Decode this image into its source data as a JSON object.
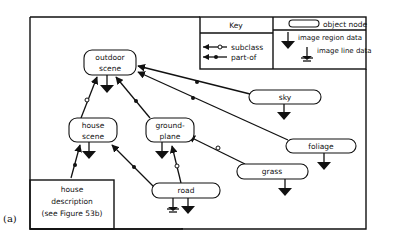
{
  "figure": {
    "caption": "(a)",
    "key": {
      "title": "Key",
      "object_node_label": "object node",
      "subclass_label": "subclass",
      "part_of_label": "part-of",
      "image_region_label": "image region data",
      "image_line_label": "image line data"
    },
    "nodes": {
      "outdoor_scene": {
        "line1": "outdoor",
        "line2": "scene"
      },
      "house_scene": {
        "line1": "house",
        "line2": "scene"
      },
      "ground_plane": {
        "line1": "ground-",
        "line2": "plane"
      },
      "sky": {
        "label": "sky"
      },
      "foliage": {
        "label": "foliage"
      },
      "grass": {
        "label": "grass"
      },
      "road": {
        "label": "road"
      },
      "house_description": {
        "line1": "house",
        "line2": "description",
        "line3": "(see Figure 53b)"
      }
    },
    "edges": [
      {
        "from": "house_scene",
        "to": "outdoor_scene",
        "type": "subclass"
      },
      {
        "from": "ground_plane",
        "to": "outdoor_scene",
        "type": "part-of"
      },
      {
        "from": "sky",
        "to": "outdoor_scene",
        "type": "part-of"
      },
      {
        "from": "foliage",
        "to": "outdoor_scene",
        "type": "part-of"
      },
      {
        "from": "house_description",
        "to": "house_scene",
        "type": "part-of"
      },
      {
        "from": "road",
        "to": "house_scene",
        "type": "part-of"
      },
      {
        "from": "road",
        "to": "ground_plane",
        "type": "subclass"
      },
      {
        "from": "grass",
        "to": "ground_plane",
        "type": "subclass"
      }
    ]
  }
}
